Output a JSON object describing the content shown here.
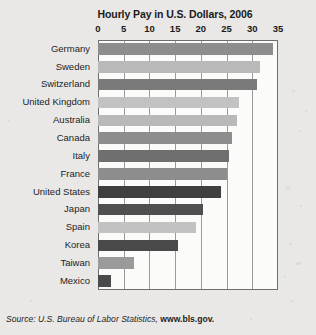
{
  "chart_data": {
    "type": "bar",
    "orientation": "horizontal",
    "title": "Hourly Pay in U.S. Dollars, 2006",
    "xlabel": "",
    "ylabel": "",
    "xlim": [
      0,
      35
    ],
    "xticks": [
      0,
      5,
      10,
      15,
      20,
      25,
      30,
      35
    ],
    "grid": true,
    "legend": false,
    "categories": [
      "Germany",
      "Sweden",
      "Switzerland",
      "United Kingdom",
      "Australia",
      "Canada",
      "Italy",
      "France",
      "United States",
      "Japan",
      "Spain",
      "Korea",
      "Taiwan",
      "Mexico"
    ],
    "values": [
      34.0,
      31.5,
      31.0,
      27.5,
      27.0,
      26.0,
      25.5,
      25.0,
      24.0,
      20.5,
      19.0,
      15.5,
      7.0,
      2.5
    ],
    "bar_colors": [
      "#8d8d8d",
      "#b9b9b9",
      "#7a7a7a",
      "#c2c2c2",
      "#b9b9b9",
      "#8d8d8d",
      "#6f6f6f",
      "#8d8d8d",
      "#3f3f3f",
      "#4f4f4f",
      "#c2c2c2",
      "#4a4a4a",
      "#9a9a9a",
      "#4a4a4a"
    ],
    "annotations": []
  },
  "source": {
    "prefix": "Source: U.S. Bureau of Labor Statistics, ",
    "site": "www.bls.gov."
  },
  "colors": {
    "page_background": "#e9e8e6",
    "plot_background": "#fbfbfa",
    "axis": "#6e6e6e",
    "gridline": "#9a9a9a",
    "text": "#1a1a1a"
  }
}
